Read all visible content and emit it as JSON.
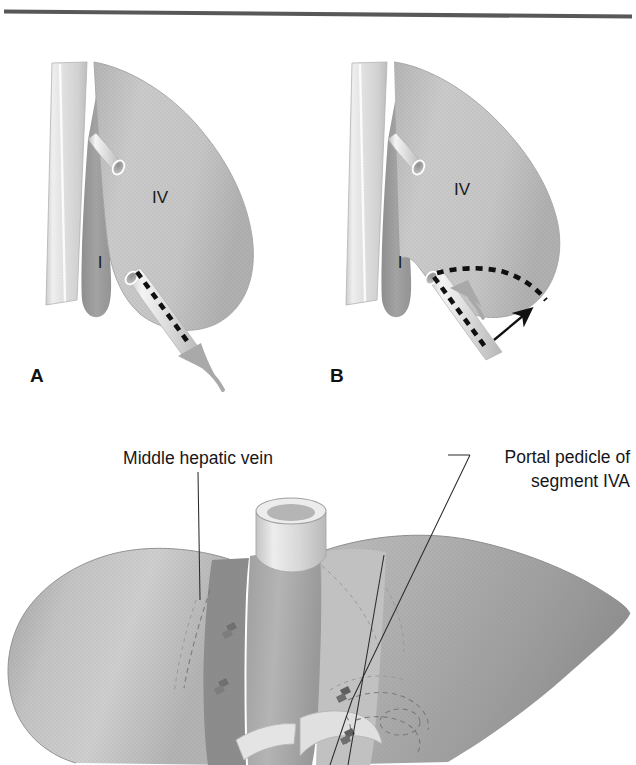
{
  "figure": {
    "domain": "medical-illustration",
    "top_rule": {
      "visible": true,
      "color": "#585858"
    },
    "background_color": "#ffffff"
  },
  "panels": [
    {
      "id": "A",
      "letter": "A",
      "region_labels": [
        {
          "name": "segment-iv-label",
          "text": "IV"
        },
        {
          "name": "segment-i-label",
          "text": "I"
        }
      ],
      "annotations": {
        "dashed_transection_line": "straight diagonal dashed line",
        "gray_arrow": "curved retraction arrow pointing up-left"
      }
    },
    {
      "id": "B",
      "letter": "B",
      "region_labels": [
        {
          "name": "segment-iv-label",
          "text": "IV"
        },
        {
          "name": "segment-i-label",
          "text": "I"
        }
      ],
      "annotations": {
        "dashed_transection_line": "curved dashed line along retracted liver edge",
        "gray_arrow": "short gray retraction arrow",
        "black_arrow": "thin black arrow pointing up-right"
      }
    }
  ],
  "callouts": [
    {
      "name": "middle-hepatic-vein-callout",
      "text": "Middle hepatic vein",
      "align": "center",
      "lines": [
        "Middle hepatic vein"
      ]
    },
    {
      "name": "portal-pedicle-callout",
      "text": "Portal pedicle of segment IVA",
      "align": "right",
      "lines": [
        "Portal pedicle of",
        "segment IVA"
      ]
    }
  ],
  "colors": {
    "liver_light": "#c9c9c9",
    "liver_mid": "#b4b4b4",
    "liver_dark": "#9b9b9b",
    "liver_darker": "#8a8a8a",
    "vena_cava": "#e2e2e2",
    "vessel_pale": "#dedede",
    "cut_line": "#101010",
    "leader_line": "#2b2b2b",
    "text": "#16161a",
    "rule": "#585858",
    "background": "#ffffff"
  }
}
